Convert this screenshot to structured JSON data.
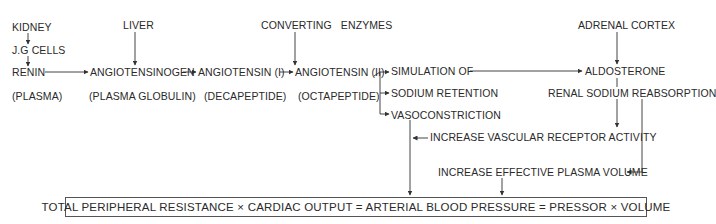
{
  "diagram": {
    "type": "flowchart",
    "nodes": {
      "kidney": "KIDNEY",
      "jg_cells": "J.G CELLS",
      "renin": "RENIN",
      "renin_sub": "(PLASMA)",
      "liver": "LIVER",
      "angiotensinogen": "ANGIOTENSINOGEN",
      "angiotensinogen_sub": "(PLASMA GLOBULIN)",
      "angiotensin1": "ANGIOTENSIN (I)",
      "angiotensin1_sub": "(DECAPEPTIDE)",
      "converting_enzymes": "CONVERTING   ENZYMES",
      "angiotensin2": "ANGIOTENSIN (II)",
      "angiotensin2_sub": "(OCTAPEPTIDE)",
      "simulation_of": "SIMULATION OF",
      "sodium_retention": "SODIUM RETENTION",
      "vasoconstriction": "VASOCONSTRICTION",
      "adrenal_cortex": "ADRENAL CORTEX",
      "aldosterone": "ALDOSTERONE",
      "renal_sodium": "RENAL SODIUM REABSORPTION",
      "vascular_receptor": "INCREASE VASCULAR RECEPTOR ACTIVITY",
      "plasma_volume": "INCREASE EFFECTIVE PLASMA VOLUME",
      "equation": "TOTAL PERIPHERAL RESISTANCE × CARDIAC OUTPUT = ARTERIAL BLOOD PRESSURE = PRESSOR × VOLUME"
    },
    "edges": [
      [
        "KIDNEY",
        "J.G CELLS"
      ],
      [
        "J.G CELLS",
        "RENIN"
      ],
      [
        "RENIN",
        "ANGIOTENSINOGEN"
      ],
      [
        "LIVER",
        "ANGIOTENSINOGEN"
      ],
      [
        "ANGIOTENSINOGEN",
        "ANGIOTENSIN (I)"
      ],
      [
        "ANGIOTENSIN (I)",
        "ANGIOTENSIN (II)"
      ],
      [
        "CONVERTING ENZYMES",
        "ANGIOTENSIN (II)"
      ],
      [
        "ANGIOTENSIN (II)",
        "SIMULATION OF"
      ],
      [
        "ANGIOTENSIN (II)",
        "SODIUM RETENTION"
      ],
      [
        "ANGIOTENSIN (II)",
        "VASOCONSTRICTION"
      ],
      [
        "SIMULATION OF",
        "ALDOSTERONE"
      ],
      [
        "ADRENAL CORTEX",
        "ALDOSTERONE"
      ],
      [
        "ALDOSTERONE",
        "RENAL SODIUM REABSORPTION"
      ],
      [
        "RENAL SODIUM REABSORPTION",
        "INCREASE VASCULAR RECEPTOR ACTIVITY"
      ],
      [
        "RENAL SODIUM REABSORPTION",
        "INCREASE EFFECTIVE PLASMA VOLUME"
      ],
      [
        "INCREASE VASCULAR RECEPTOR ACTIVITY",
        "VASOCONSTRICTION path"
      ],
      [
        "VASOCONSTRICTION",
        "EQUATION"
      ],
      [
        "INCREASE EFFECTIVE PLASMA VOLUME",
        "EQUATION"
      ]
    ],
    "colors": {
      "line": "#3a3a3a",
      "text": "#2a2a2a",
      "background": "#ffffff"
    }
  }
}
